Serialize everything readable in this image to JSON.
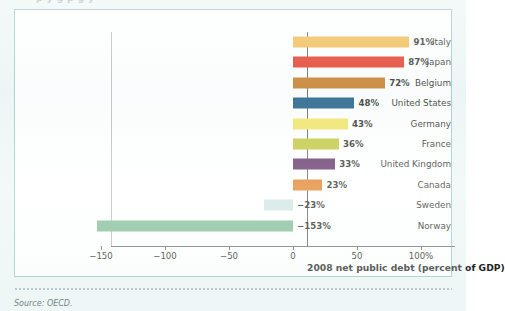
{
  "figure": {
    "top_cut_text": "p  y g p  g y",
    "source_note": "Source: OECD.",
    "frame_color": "#9ec7c7",
    "plot_background": "#ffffff"
  },
  "chart_data": {
    "type": "bar",
    "orientation": "horizontal",
    "title": "",
    "xlabel": "2008 net public debt (percent of GDP)",
    "ylabel": "",
    "xlim": [
      -170,
      120
    ],
    "xticks": [
      -150,
      -100,
      -50,
      0,
      50,
      100
    ],
    "xtick_labels": [
      "−150",
      "−100",
      "−50",
      "0",
      "50",
      "100%"
    ],
    "grid": false,
    "legend": "none",
    "zero_line": 0,
    "categories": [
      "Italy",
      "Japan",
      "Belgium",
      "United States",
      "Germany",
      "France",
      "United Kingdom",
      "Canada",
      "Sweden",
      "Norway"
    ],
    "values": [
      91,
      87,
      72,
      48,
      43,
      36,
      33,
      23,
      -23,
      -153
    ],
    "value_labels": [
      "91%",
      "87%",
      "72%",
      "48%",
      "43%",
      "36%",
      "33%",
      "23%",
      "−23%",
      "−153%"
    ],
    "colors": [
      "#efb847",
      "#e32c18",
      "#c4741a",
      "#13557f",
      "#f2e35c",
      "#bfc433",
      "#5b2a62",
      "#e07b1e",
      "#cde5e4",
      "#7fbb92"
    ]
  }
}
